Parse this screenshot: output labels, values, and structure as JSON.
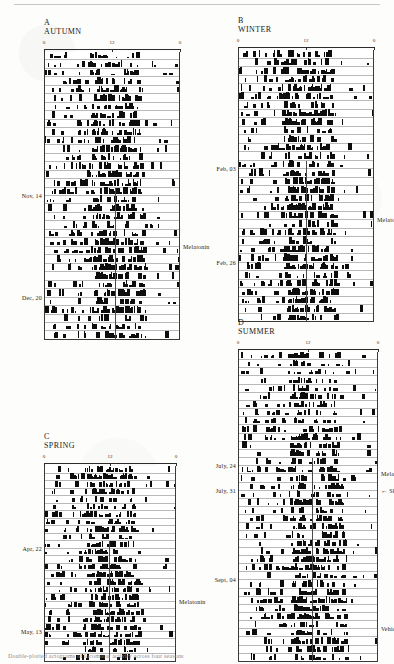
{
  "figure": {
    "caption": "Double-plotted actograms of locomotor activity across four seasons",
    "axis": {
      "ticks": [
        "0",
        "12",
        "0"
      ],
      "tick_positions": [
        0,
        50,
        100
      ],
      "unit": "hours"
    }
  },
  "panels": [
    {
      "letter": "A",
      "title": "AUTUMN",
      "rows": 34,
      "date_labels": [
        {
          "text": "Nov, 14",
          "row": 17
        },
        {
          "text": "Dec, 20",
          "row": 29
        }
      ],
      "annotations": [
        {
          "text": "Melatonin",
          "row": 23,
          "type": "label"
        }
      ],
      "onset_x": 52,
      "onset_start_row": 16
    },
    {
      "letter": "B",
      "title": "WINTER",
      "rows": 32,
      "date_labels": [
        {
          "text": "Feb, 03",
          "row": 14
        },
        {
          "text": "Feb, 26",
          "row": 25
        }
      ],
      "annotations": [
        {
          "text": "Melatonin",
          "row": 20,
          "type": "label"
        }
      ],
      "onset_x": 50,
      "onset_start_row": 13
    },
    {
      "letter": "C",
      "title": "SPRING",
      "rows": 26,
      "date_labels": [
        {
          "text": "Apr, 22",
          "row": 11
        },
        {
          "text": "May, 13",
          "row": 22
        }
      ],
      "annotations": [
        {
          "text": "Melatonin",
          "row": 18,
          "type": "label"
        }
      ],
      "onset_x": 49,
      "onset_start_row": 10
    },
    {
      "letter": "D",
      "title": "SUMMER",
      "rows": 38,
      "date_labels": [
        {
          "text": "July, 24",
          "row": 14
        },
        {
          "text": "July, 31",
          "row": 17
        },
        {
          "text": "Sept, 04",
          "row": 28
        }
      ],
      "annotations": [
        {
          "text": "Melatonin",
          "row": 15,
          "type": "label"
        },
        {
          "text": "Shift",
          "row": 17,
          "type": "arrow"
        },
        {
          "text": "Vehicle",
          "row": 34,
          "type": "label"
        }
      ],
      "onset_x": 53,
      "onset_start_row": 13
    }
  ],
  "chart_data": {
    "type": "actogram",
    "xlabel": "Time of day (h)",
    "ylabel": "Days",
    "xlim": [
      0,
      24
    ],
    "xticks": [
      0,
      12,
      24
    ],
    "xticklabels": [
      "0",
      "12",
      "0"
    ],
    "grid": false,
    "legend": [
      "Melatonin",
      "Vehicle",
      "Shift"
    ],
    "series": [
      {
        "name": "AUTUMN",
        "panel": "A",
        "days": 34,
        "date_markers": {
          "Nov, 14": 17,
          "Dec, 20": 29
        },
        "treatment_onset_day": 16,
        "activity_onset_hour": 12.5
      },
      {
        "name": "WINTER",
        "panel": "B",
        "days": 32,
        "date_markers": {
          "Feb, 03": 14,
          "Feb, 26": 25
        },
        "treatment_onset_day": 13,
        "activity_onset_hour": 12.0
      },
      {
        "name": "SPRING",
        "panel": "C",
        "days": 26,
        "date_markers": {
          "Apr, 22": 11,
          "May, 13": 22
        },
        "treatment_onset_day": 10,
        "activity_onset_hour": 11.8
      },
      {
        "name": "SUMMER",
        "panel": "D",
        "days": 38,
        "date_markers": {
          "July, 24": 14,
          "July, 31": 17,
          "Sept, 04": 28
        },
        "treatment_onset_day": 13,
        "activity_onset_hour": 12.7
      }
    ]
  }
}
